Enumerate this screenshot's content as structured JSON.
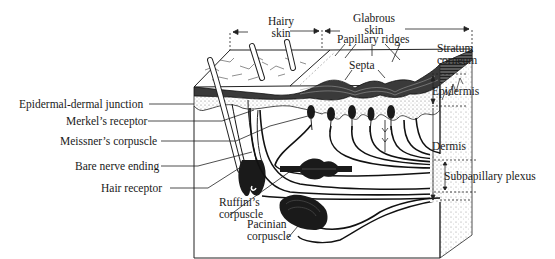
{
  "diagram": {
    "colors": {
      "ink": "#1a1a1a",
      "background": "#ffffff",
      "stipple": "#9a9a9a"
    },
    "top_labels": {
      "hairy_skin": [
        "Hairy",
        "skin"
      ],
      "glabrous_skin": [
        "Glabrous",
        "skin"
      ],
      "papillary_ridges": "Papillary ridges",
      "septa": "Septa"
    },
    "left_labels": [
      {
        "id": "epidermal-dermal-junction",
        "text": "Epidermal-dermal junction"
      },
      {
        "id": "merkels-receptor",
        "text": "Merkel’s receptor"
      },
      {
        "id": "meissners-corpuscle",
        "text": "Meissner’s corpuscle"
      },
      {
        "id": "bare-nerve-ending",
        "text": "Bare nerve ending"
      },
      {
        "id": "hair-receptor",
        "text": "Hair receptor"
      }
    ],
    "bottom_labels": {
      "ruffini": [
        "Ruffini’s",
        "corpuscle"
      ],
      "pacinian": [
        "Pacinian",
        "corpuscle"
      ]
    },
    "right_labels": {
      "stratum_corneum": [
        "Stratum",
        "corneum"
      ],
      "epidermis": "Epidermis",
      "dermis": "Dermis",
      "subpapillary_plexus": "Subpapillary plexus"
    }
  }
}
